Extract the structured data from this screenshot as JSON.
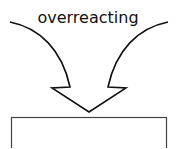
{
  "diagram": {
    "label": "overreacting",
    "colors": {
      "stroke": "#111111",
      "background": "#ffffff"
    },
    "shapes": [
      {
        "type": "converging-curved-arrows",
        "tip": [
          89,
          112
        ]
      },
      {
        "type": "rectangle",
        "x": 11,
        "y": 117,
        "width": 156
      }
    ]
  }
}
